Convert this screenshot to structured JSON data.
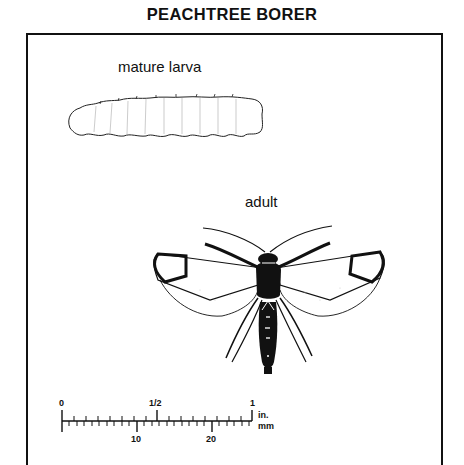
{
  "title": "PEACHTREE BORER",
  "labels": {
    "larva": "mature larva",
    "adult": "adult"
  },
  "scale_bar": {
    "inch_ticks": [
      "0",
      "1/2",
      "1"
    ],
    "mm_ticks": [
      "10",
      "20"
    ],
    "unit_top": "in.",
    "unit_bottom": "mm"
  },
  "colors": {
    "ink": "#111111",
    "background": "#ffffff"
  }
}
